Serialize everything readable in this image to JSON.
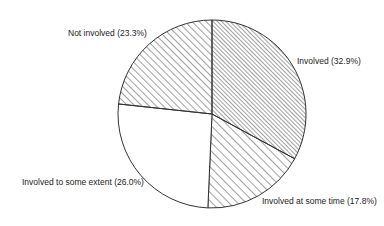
{
  "chart_data": {
    "type": "pie",
    "title": "",
    "start_angle_deg": 0,
    "direction": "clockwise",
    "slices": [
      {
        "label": "Involved",
        "value": 32.9,
        "display": "Involved (32.9%)",
        "pattern": "dense-diagonal",
        "spacing": 3
      },
      {
        "label": "Involved at some time",
        "value": 17.8,
        "display": "Involved at some time (17.8%)",
        "pattern": "diagonal",
        "spacing": 6
      },
      {
        "label": "Involved to some extent",
        "value": 26.0,
        "display": "Involved to some extent (26.0%)",
        "pattern": "none",
        "spacing": 0
      },
      {
        "label": "Not involved",
        "value": 23.3,
        "display": "Not involved (23.3%)",
        "pattern": "diagonal",
        "spacing": 5
      }
    ],
    "center": [
      212,
      114
    ],
    "radius": 94,
    "legend": "none (labels placed next to slices)"
  },
  "labels": {
    "involved": "Involved (32.9%)",
    "at_some_time": "Involved at some time (17.8%)",
    "some_extent": "Involved to some extent (26.0%)",
    "not_involved": "Not involved (23.3%)"
  },
  "colors": {
    "stroke": "#333333",
    "hatch": "#444444",
    "background": "#ffffff"
  }
}
